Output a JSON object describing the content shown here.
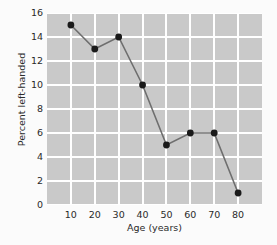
{
  "chart_data": {
    "type": "line",
    "title": "",
    "xlabel": "Age (years)",
    "ylabel": "Percent left-handed",
    "x": [
      10,
      20,
      30,
      40,
      50,
      60,
      70,
      80
    ],
    "values": [
      15,
      13,
      14,
      10,
      5,
      6,
      6,
      1
    ],
    "series": [
      {
        "name": "Percent left-handed",
        "values": [
          15,
          13,
          14,
          10,
          5,
          6,
          6,
          1
        ]
      }
    ],
    "xtick_labels": [
      "10",
      "20",
      "30",
      "40",
      "50",
      "60",
      "70",
      "80"
    ],
    "ytick_labels": [
      "0",
      "2",
      "4",
      "6",
      "8",
      "10",
      "12",
      "14",
      "16"
    ],
    "xticks": [
      10,
      20,
      30,
      40,
      50,
      60,
      70,
      80
    ],
    "yticks": [
      0,
      2,
      4,
      6,
      8,
      10,
      12,
      14,
      16
    ],
    "xlim": [
      0,
      90
    ],
    "ylim": [
      0,
      16
    ],
    "grid": true,
    "legend": false,
    "legend_position": "none",
    "marker": "circle",
    "colors": {
      "plot_background": "#c9c9c9",
      "figure_background": "#fbfbfb",
      "gridline": "#ffffff",
      "line": "#6e6e6e",
      "marker": "#1a1a1a",
      "text": "#2a2a2a"
    }
  }
}
